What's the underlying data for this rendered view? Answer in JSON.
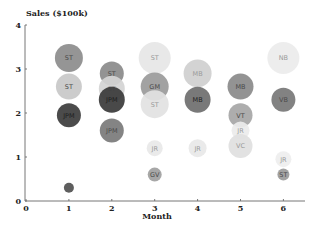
{
  "chart_data": {
    "type": "scatter",
    "subtype": "bubble",
    "title": "",
    "xlabel": "Month",
    "ylabel": "Sales ($100k)",
    "xlim": [
      0,
      6.5
    ],
    "ylim": [
      0,
      4
    ],
    "xticks": [
      0,
      1,
      2,
      3,
      4,
      5,
      6
    ],
    "yticks": [
      0,
      1,
      2,
      3,
      4
    ],
    "grid": false,
    "legend": null,
    "points": [
      {
        "x": 1,
        "y": 3.25,
        "r": 14,
        "label": "ST",
        "color": "#8c8c8c"
      },
      {
        "x": 1,
        "y": 2.6,
        "r": 13,
        "label": "ST",
        "color": "#c8c8c8"
      },
      {
        "x": 1,
        "y": 1.95,
        "r": 12,
        "label": "JPM",
        "color": "#3c3c3c"
      },
      {
        "x": 1,
        "y": 0.3,
        "r": 5,
        "label": "JP",
        "color": "#505050"
      },
      {
        "x": 2,
        "y": 2.9,
        "r": 12,
        "label": "ST",
        "color": "#8a8a8a"
      },
      {
        "x": 2,
        "y": 2.55,
        "r": 13,
        "label": "ST",
        "color": "#d4d4d4"
      },
      {
        "x": 2,
        "y": 2.3,
        "r": 13,
        "label": "JPM",
        "color": "#3a3a3a"
      },
      {
        "x": 2,
        "y": 1.6,
        "r": 12,
        "label": "JPM",
        "color": "#7a7a7a"
      },
      {
        "x": 3,
        "y": 3.25,
        "r": 16,
        "label": "ST",
        "color": "#e6e6e6"
      },
      {
        "x": 3,
        "y": 2.6,
        "r": 14,
        "label": "GM",
        "color": "#9a9a9a"
      },
      {
        "x": 3,
        "y": 2.2,
        "r": 14,
        "label": "ST",
        "color": "#e2e2e2"
      },
      {
        "x": 3,
        "y": 1.2,
        "r": 8,
        "label": "JR",
        "color": "#e8e8e8"
      },
      {
        "x": 3,
        "y": 0.6,
        "r": 7,
        "label": "GV",
        "color": "#a0a0a0"
      },
      {
        "x": 4,
        "y": 2.9,
        "r": 14,
        "label": "MB",
        "color": "#cfcfcf"
      },
      {
        "x": 4,
        "y": 2.3,
        "r": 13,
        "label": "MB",
        "color": "#6e6e6e"
      },
      {
        "x": 4,
        "y": 1.2,
        "r": 9,
        "label": "JR",
        "color": "#e8e8e8"
      },
      {
        "x": 5,
        "y": 2.6,
        "r": 13,
        "label": "MB",
        "color": "#8a8a8a"
      },
      {
        "x": 5,
        "y": 1.95,
        "r": 12,
        "label": "VT",
        "color": "#a6a6a6"
      },
      {
        "x": 5,
        "y": 1.6,
        "r": 9,
        "label": "JR",
        "color": "#ececec"
      },
      {
        "x": 5,
        "y": 1.25,
        "r": 12,
        "label": "VC",
        "color": "#e0e0e0"
      },
      {
        "x": 6,
        "y": 3.25,
        "r": 16,
        "label": "NB",
        "color": "#ebebeb"
      },
      {
        "x": 6,
        "y": 2.3,
        "r": 12,
        "label": "VB",
        "color": "#777777"
      },
      {
        "x": 6,
        "y": 0.95,
        "r": 8,
        "label": "JR",
        "color": "#eeeeee"
      },
      {
        "x": 6,
        "y": 0.6,
        "r": 6,
        "label": "ST",
        "color": "#9a9a9a"
      }
    ]
  },
  "axes": {
    "y_title": "Sales ($100k)",
    "x_title": "Month",
    "y_ticks": [
      "0",
      "1",
      "2",
      "3",
      "4"
    ],
    "x_ticks": [
      "0",
      "1",
      "2",
      "3",
      "4",
      "5",
      "6"
    ]
  },
  "colors": {
    "axis": "#777777",
    "text": "#222222",
    "background": "#ffffff"
  }
}
